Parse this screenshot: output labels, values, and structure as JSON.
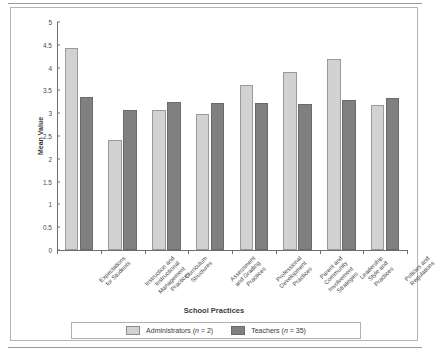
{
  "figure": {
    "y_axis_title": "Mean Value",
    "x_axis_title": "School Practices"
  },
  "legend": {
    "items": [
      {
        "key": "admin",
        "label": "Administrators (n = 2)"
      },
      {
        "key": "teach",
        "label": "Teachers (n = 35)"
      }
    ]
  },
  "chart_data": {
    "type": "bar",
    "title": "",
    "xlabel": "School Practices",
    "ylabel": "Mean Value",
    "ylim": [
      0,
      5
    ],
    "ytick_labels": [
      "5",
      "4.5",
      "4",
      "3.5",
      "3",
      "2.5",
      "2",
      "1.5",
      "1",
      "0.5",
      "0"
    ],
    "ytick_values": [
      5,
      4.5,
      4,
      3.5,
      3,
      2.5,
      2,
      1.5,
      1,
      0.5,
      0
    ],
    "grid": false,
    "legend_position": "bottom",
    "categories": [
      "Expectations for Students",
      "Instruction and Instructional Management Practices",
      "Curriculum Structures",
      "Assessment and Grading Practices",
      "Professional Development Practices",
      "Parent and Community Involvement Strategies",
      "Leadership Style and Practices",
      "Policies and Regulations"
    ],
    "category_lines": [
      [
        "Expectations",
        "for Students"
      ],
      [
        "Instruction and",
        "Instructional",
        "Management",
        "Practices"
      ],
      [
        "Curriculum",
        "Structures"
      ],
      [
        "Assessment",
        "and Grading",
        "Practices"
      ],
      [
        "Professional",
        "Development",
        "Practices"
      ],
      [
        "Parent and",
        "Community",
        "Involvement",
        "Strategies"
      ],
      [
        "Leadership",
        "Style and",
        "Practices"
      ],
      [
        "Policies and",
        "Regulations"
      ]
    ],
    "series": [
      {
        "name": "Administrators (n = 2)",
        "key": "admin",
        "color": "#d2d2d2",
        "values": [
          4.43,
          2.42,
          3.06,
          2.99,
          3.62,
          3.91,
          4.18,
          3.18
        ]
      },
      {
        "name": "Teachers (n = 35)",
        "key": "teach",
        "color": "#808080",
        "values": [
          3.35,
          3.08,
          3.25,
          3.22,
          3.22,
          3.2,
          3.28,
          3.34
        ]
      }
    ]
  }
}
